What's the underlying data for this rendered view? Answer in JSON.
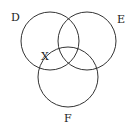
{
  "diagram": {
    "type": "venn",
    "sets": [
      {
        "label": "D",
        "cx": 50,
        "cy": 41,
        "r": 29,
        "label_x": 11,
        "label_y": 21
      },
      {
        "label": "E",
        "cx": 87,
        "cy": 41,
        "r": 29,
        "label_x": 117,
        "label_y": 23
      },
      {
        "label": "F",
        "cx": 68,
        "cy": 77,
        "r": 30,
        "label_x": 64,
        "label_y": 122
      }
    ],
    "region_marker": {
      "label": "X",
      "x": 41,
      "y": 60
    },
    "stroke_color": "#333333"
  }
}
